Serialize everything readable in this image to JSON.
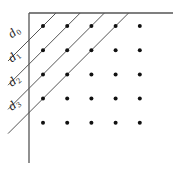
{
  "diagram": {
    "grid": {
      "rows": 5,
      "cols": 5
    },
    "diagonal_labels": [
      {
        "base": "d",
        "sub": "0"
      },
      {
        "base": "d",
        "sub": "1"
      },
      {
        "base": "d",
        "sub": "2"
      },
      {
        "base": "d",
        "sub": "3"
      }
    ],
    "line_color": "#555555",
    "dot_color": "#111111"
  }
}
